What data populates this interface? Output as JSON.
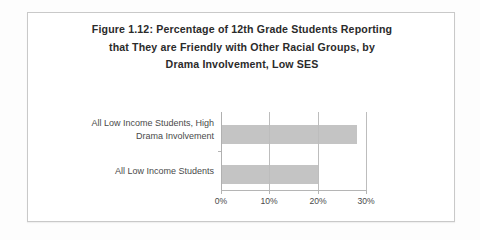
{
  "document": {
    "kind": "scanned-figure"
  },
  "figure": {
    "title_lines": [
      "Figure 1.12:  Percentage of 12th Grade Students Reporting",
      "that They are Friendly with Other Racial Groups, by",
      "Drama Involvement, Low SES"
    ],
    "border_color": "#c9c9c9"
  },
  "chart_data": {
    "type": "bar",
    "orientation": "horizontal",
    "title": "Figure 1.12:  Percentage of 12th Grade Students Reporting that They are Friendly with Other Racial Groups, by Drama Involvement, Low SES",
    "categories": [
      "All Low Income Students, High Drama Involvement",
      "All Low Income Students"
    ],
    "category_label_lines": [
      [
        "All Low Income Students, High",
        "Drama Involvement"
      ],
      [
        "All Low Income Students"
      ]
    ],
    "values": [
      28,
      20
    ],
    "value_unit": "percent",
    "xlabel": "",
    "ylabel": "",
    "xlim": [
      0,
      30
    ],
    "xticks": [
      0,
      10,
      20,
      30
    ],
    "xtick_labels": [
      "0%",
      "10%",
      "20%",
      "30%"
    ],
    "grid": true,
    "grid_axis": "x",
    "legend": false,
    "bar_color": "#c4c4c4",
    "gridline_color": "#bdbdbd",
    "axis_color": "#b5b5b5"
  }
}
